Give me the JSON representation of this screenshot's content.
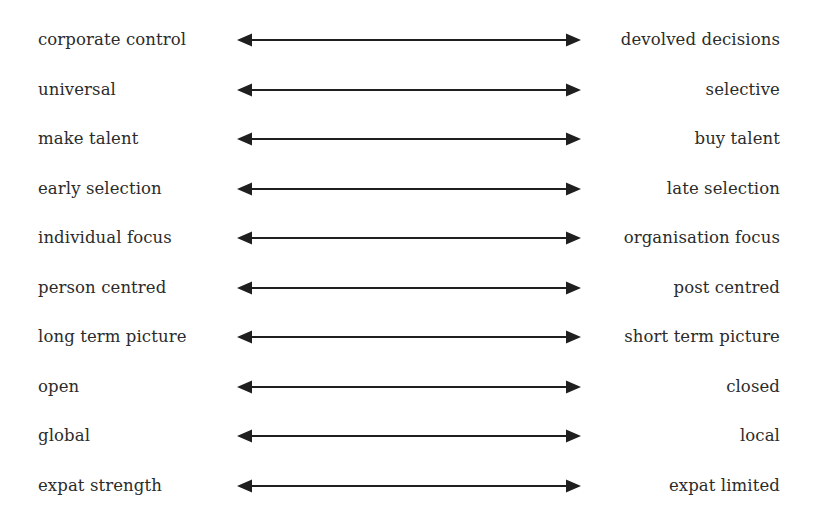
{
  "diagram": {
    "type": "bipolar-continuum-scale",
    "background_color": "#ffffff",
    "text_color": "#2b2b2b",
    "arrow_color": "#1f1f1f",
    "arrow_icon_name": "double-headed-arrow-icon",
    "rows": [
      {
        "left": "corporate control",
        "right": "devolved decisions"
      },
      {
        "left": "universal",
        "right": "selective"
      },
      {
        "left": "make talent",
        "right": "buy talent"
      },
      {
        "left": "early selection",
        "right": "late selection"
      },
      {
        "left": "individual focus",
        "right": "organisation focus"
      },
      {
        "left": "person centred",
        "right": "post centred"
      },
      {
        "left": "long term picture",
        "right": "short term picture"
      },
      {
        "left": "open",
        "right": "closed"
      },
      {
        "left": "global",
        "right": "local"
      },
      {
        "left": "expat strength",
        "right": "expat limited"
      }
    ]
  }
}
